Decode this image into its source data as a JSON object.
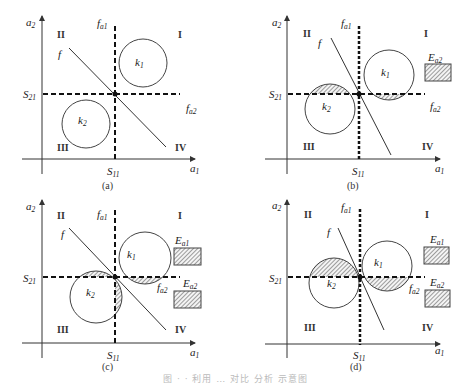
{
  "figure": {
    "caption": "图 · · 利用 … 对比 分析 示意图",
    "panels": [
      {
        "id": "a",
        "label": "(a)",
        "axis_x": "a",
        "axis_x_sub": "1",
        "axis_y": "a",
        "axis_y_sub": "2",
        "s_x": "S",
        "s_x_sub": "11",
        "s_y": "S",
        "s_y_sub": "21",
        "f": "f",
        "fa1": "f",
        "fa1_sub": "a1",
        "fa2": "f",
        "fa2_sub": "a2",
        "k1": "k",
        "k1_sub": "1",
        "k2": "k",
        "k2_sub": "2",
        "quadrants": [
          "I",
          "II",
          "III",
          "IV"
        ],
        "legend": []
      },
      {
        "id": "b",
        "label": "(b)",
        "axis_x": "a",
        "axis_x_sub": "1",
        "axis_y": "a",
        "axis_y_sub": "2",
        "s_x": "S",
        "s_x_sub": "11",
        "s_y": "S",
        "s_y_sub": "21",
        "f": "f",
        "fa1": "f",
        "fa1_sub": "a1",
        "fa2": "f",
        "fa2_sub": "a2",
        "k1": "k",
        "k1_sub": "1",
        "k2": "k",
        "k2_sub": "2",
        "quadrants": [
          "I",
          "II",
          "III",
          "IV"
        ],
        "legend": [
          {
            "name": "E",
            "sub": "a2"
          }
        ]
      },
      {
        "id": "c",
        "label": "(c)",
        "axis_x": "a",
        "axis_x_sub": "1",
        "axis_y": "a",
        "axis_y_sub": "2",
        "s_x": "S",
        "s_x_sub": "11",
        "s_y": "S",
        "s_y_sub": "21",
        "f": "f",
        "fa1": "f",
        "fa1_sub": "a1",
        "fa2": "f",
        "fa2_sub": "a2",
        "k1": "k",
        "k1_sub": "1",
        "k2": "k",
        "k2_sub": "2",
        "quadrants": [
          "I",
          "II",
          "III",
          "IV"
        ],
        "legend": [
          {
            "name": "E",
            "sub": "a1"
          },
          {
            "name": "E",
            "sub": "a2"
          }
        ]
      },
      {
        "id": "d",
        "label": "(d)",
        "axis_x": "a",
        "axis_x_sub": "1",
        "axis_y": "a",
        "axis_y_sub": "2",
        "s_x": "S",
        "s_x_sub": "11",
        "s_y": "S",
        "s_y_sub": "21",
        "f": "f",
        "fa1": "f",
        "fa1_sub": "a1",
        "fa2": "f",
        "fa2_sub": "a2",
        "k1": "k",
        "k1_sub": "1",
        "k2": "k",
        "k2_sub": "2",
        "quadrants": [
          "I",
          "II",
          "III",
          "IV"
        ],
        "legend": [
          {
            "name": "E",
            "sub": "a1"
          },
          {
            "name": "E",
            "sub": "a2"
          }
        ]
      }
    ]
  }
}
